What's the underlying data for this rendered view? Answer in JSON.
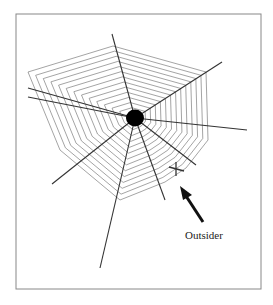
{
  "figure": {
    "label": "Outsider",
    "frame": {
      "x": 16,
      "y": 14,
      "w": 245,
      "h": 275,
      "stroke": "#888888"
    },
    "center": {
      "x": 135,
      "y": 118,
      "r": 9
    },
    "cross": {
      "x": 176,
      "y": 169,
      "size": 6
    },
    "arrow": {
      "tail": [
        203,
        222
      ],
      "tip": [
        181,
        188
      ]
    },
    "rays": [
      [
        112,
        34
      ],
      [
        222,
        62
      ],
      [
        247,
        130
      ],
      [
        196,
        165
      ],
      [
        165,
        200
      ],
      [
        100,
        268
      ],
      [
        52,
        184
      ],
      [
        28,
        97
      ],
      [
        28,
        88
      ]
    ],
    "colors": {
      "web": "#555555",
      "ray": "#333333",
      "center": "#000000",
      "text": "#222222"
    }
  }
}
